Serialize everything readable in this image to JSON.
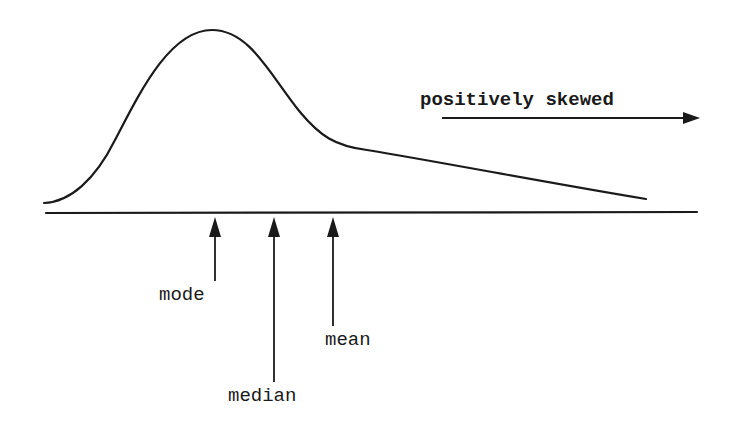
{
  "diagram": {
    "direction_label": "positively skewed",
    "markers": [
      {
        "id": "mode",
        "label": "mode",
        "order": 1
      },
      {
        "id": "median",
        "label": "median",
        "order": 2
      },
      {
        "id": "mean",
        "label": "mean",
        "order": 3
      }
    ],
    "colors": {
      "ink": "#1a1a1a",
      "background": "#ffffff"
    }
  }
}
